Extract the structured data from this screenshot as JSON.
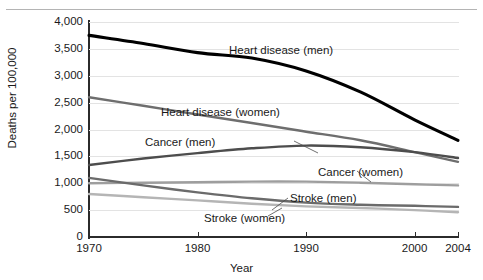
{
  "chart_data": {
    "type": "line",
    "title": "",
    "xlabel": "Year",
    "ylabel": "Deaths per 100,000",
    "xlim": [
      1970,
      2004
    ],
    "ylim": [
      0,
      4000
    ],
    "grid": true,
    "legend_position": "inline-annotations",
    "x": [
      1970,
      1975,
      1980,
      1985,
      1990,
      1995,
      2000,
      2004
    ],
    "yticks": [
      "0",
      "500",
      "1,000",
      "1,500",
      "2,000",
      "2,500",
      "3,000",
      "3,500",
      "4,000"
    ],
    "ytick_values": [
      0,
      500,
      1000,
      1500,
      2000,
      2500,
      3000,
      3500,
      4000
    ],
    "xticks": [
      "1970",
      "1980",
      "1990",
      "2000",
      "2004"
    ],
    "xtick_values": [
      1970,
      1980,
      1990,
      2000,
      2004
    ],
    "series": [
      {
        "name": "Heart disease (men)",
        "color": "#000000",
        "width": 3.1,
        "x": [
          1970,
          1975,
          1980,
          1985,
          1990,
          1995,
          2000,
          2004
        ],
        "values": [
          3750,
          3600,
          3430,
          3330,
          3090,
          2700,
          2180,
          1800
        ]
      },
      {
        "name": "Heart disease (women)",
        "color": "#6e6e6e",
        "width": 2.4,
        "x": [
          1970,
          1975,
          1980,
          1985,
          1990,
          1995,
          2000,
          2004
        ],
        "values": [
          2600,
          2440,
          2280,
          2120,
          1960,
          1800,
          1580,
          1400
        ]
      },
      {
        "name": "Cancer (men)",
        "color": "#4d4d4d",
        "width": 2.4,
        "x": [
          1970,
          1975,
          1980,
          1985,
          1990,
          1995,
          2000,
          2004
        ],
        "values": [
          1340,
          1460,
          1560,
          1650,
          1700,
          1670,
          1580,
          1470
        ]
      },
      {
        "name": "Cancer (women)",
        "color": "#9e9e9e",
        "width": 2.4,
        "x": [
          1970,
          1975,
          1980,
          1985,
          1990,
          1995,
          2000,
          2004
        ],
        "values": [
          1000,
          1010,
          1020,
          1030,
          1030,
          1010,
          980,
          960
        ]
      },
      {
        "name": "Stroke (men)",
        "color": "#6b6b6b",
        "width": 2.4,
        "x": [
          1970,
          1975,
          1980,
          1985,
          1990,
          1995,
          2000,
          2004
        ],
        "values": [
          1100,
          960,
          830,
          720,
          640,
          600,
          580,
          560
        ]
      },
      {
        "name": "Stroke (women)",
        "color": "#b5b5b5",
        "width": 2.4,
        "x": [
          1970,
          1975,
          1980,
          1985,
          1990,
          1995,
          2000,
          2004
        ],
        "values": [
          800,
          740,
          680,
          620,
          570,
          540,
          500,
          460
        ]
      }
    ],
    "annotations": [
      {
        "text": "Heart disease (men)",
        "x_px": 229,
        "y_px": 44
      },
      {
        "text": "Heart disease (women)",
        "x_px": 161,
        "y_px": 106
      },
      {
        "text": "Cancer (men)",
        "x_px": 145,
        "y_px": 136
      },
      {
        "text": "Cancer (women)",
        "x_px": 318,
        "y_px": 166
      },
      {
        "text": "Stroke (men)",
        "x_px": 290,
        "y_px": 192
      },
      {
        "text": "Stroke (women)",
        "x_px": 204,
        "y_px": 212
      }
    ],
    "leaders": [
      {
        "from": [
          294,
          141
        ],
        "to": [
          318,
          153
        ]
      },
      {
        "from": [
          357,
          171
        ],
        "to": [
          371,
          182
        ]
      },
      {
        "from": [
          288,
          198
        ],
        "to": [
          272,
          210
        ]
      },
      {
        "from": [
          268,
          216
        ],
        "to": [
          282,
          208
        ]
      }
    ]
  }
}
